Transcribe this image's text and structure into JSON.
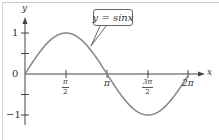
{
  "chart_data": {
    "type": "line",
    "title": "",
    "function": "y = sin x",
    "xlabel": "x",
    "ylabel": "y",
    "xlim": [
      0,
      6.5
    ],
    "ylim": [
      -1.25,
      1.25
    ],
    "grid": false,
    "legend": {
      "position": "callout",
      "entries": [
        "y = sinx"
      ]
    },
    "x_ticks": [
      {
        "value": 1.5708,
        "label": "π/2",
        "num": "π",
        "den": "2"
      },
      {
        "value": 3.1416,
        "label": "π"
      },
      {
        "value": 4.7124,
        "label": "3π/2",
        "num": "3π",
        "den": "2"
      },
      {
        "value": 6.2832,
        "label": "2π"
      }
    ],
    "y_ticks": [
      {
        "value": 1,
        "label": "1"
      },
      {
        "value": 0.5,
        "label": ""
      },
      {
        "value": 0,
        "label": "0"
      },
      {
        "value": -0.5,
        "label": ""
      },
      {
        "value": -1,
        "label": "−1"
      }
    ],
    "series": [
      {
        "name": "y = sinx",
        "color": "#8a8a8a",
        "x": [
          0,
          0.7854,
          1.5708,
          2.3562,
          3.1416,
          3.927,
          4.7124,
          5.4978,
          6.2832
        ],
        "y": [
          0,
          0.707,
          1,
          0.707,
          0,
          -0.707,
          -1,
          -0.707,
          0
        ]
      }
    ]
  },
  "labels": {
    "y_axis": "y",
    "x_axis": "x",
    "y_one": "1",
    "y_zero": "0",
    "y_neg_one": "−1",
    "pi": "π",
    "two_pi": "2π",
    "pi_half_num": "π",
    "pi_half_den": "2",
    "three_pi_half_num": "3π",
    "three_pi_half_den": "2",
    "callout": "y = sinx"
  },
  "colors": {
    "curve": "#8a8a8a",
    "axis": "#444444",
    "frame": "#c8c8c8"
  }
}
